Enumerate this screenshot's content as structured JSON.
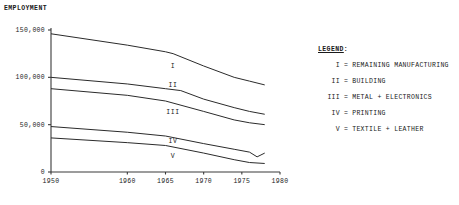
{
  "chart_data": {
    "type": "line",
    "title": "",
    "ylabel": "EMPLOYMENT",
    "xlabel": "",
    "xlim": [
      1950,
      1980
    ],
    "ylim": [
      0,
      150000
    ],
    "grid": false,
    "legend_position": "right",
    "xticks": [
      1950,
      1960,
      1965,
      1970,
      1975,
      1980
    ],
    "xtick_labels": [
      "1950",
      "1960",
      "1965",
      "1970",
      "1975",
      "1980"
    ],
    "yticks": [
      0,
      50000,
      100000,
      150000
    ],
    "ytick_labels": [
      "0",
      "50,000",
      "100,000",
      "150,000"
    ],
    "series": [
      {
        "name": "I",
        "label": "REMAINING MANUFACTURING",
        "x": [
          1950,
          1960,
          1965,
          1966,
          1970,
          1974,
          1976,
          1978
        ],
        "values": [
          146000,
          134000,
          127000,
          125000,
          112000,
          100000,
          96000,
          92000
        ]
      },
      {
        "name": "II",
        "label": "BUILDING",
        "x": [
          1950,
          1960,
          1965,
          1967,
          1970,
          1974,
          1976,
          1978
        ],
        "values": [
          100000,
          93000,
          88000,
          86000,
          77000,
          68000,
          64000,
          61000
        ]
      },
      {
        "name": "III",
        "label": "METAL + ELECTRONICS",
        "x": [
          1950,
          1960,
          1965,
          1970,
          1974,
          1976,
          1978
        ],
        "values": [
          88000,
          81000,
          75000,
          64000,
          55000,
          52000,
          50000
        ]
      },
      {
        "name": "IV",
        "label": "PRINTING",
        "x": [
          1950,
          1960,
          1965,
          1970,
          1974,
          1976,
          1977,
          1978
        ],
        "values": [
          48000,
          42000,
          38000,
          30000,
          24000,
          21000,
          16000,
          20000
        ]
      },
      {
        "name": "V",
        "label": "TEXTILE + LEATHER",
        "x": [
          1950,
          1960,
          1965,
          1970,
          1974,
          1976,
          1978
        ],
        "values": [
          36000,
          31000,
          28000,
          20000,
          13000,
          10000,
          9000
        ]
      }
    ],
    "band_labels": [
      {
        "text": "I",
        "x": 1966,
        "y": 112000
      },
      {
        "text": "II",
        "x": 1966,
        "y": 92000
      },
      {
        "text": "III",
        "x": 1966,
        "y": 63000
      },
      {
        "text": "IV",
        "x": 1966,
        "y": 33000
      },
      {
        "text": "V",
        "x": 1966,
        "y": 17000
      }
    ]
  },
  "legend": {
    "title": "LEGEND",
    "title_colon": ":",
    "equals": "=",
    "entries": [
      {
        "symbol": "I",
        "name": "REMAINING MANUFACTURING"
      },
      {
        "symbol": "II",
        "name": "BUILDING"
      },
      {
        "symbol": "III",
        "name": "METAL + ELECTRONICS"
      },
      {
        "symbol": "IV",
        "name": "PRINTING"
      },
      {
        "symbol": "V",
        "name": "TEXTILE + LEATHER"
      }
    ]
  },
  "style": {
    "line_color": "#2b2b2b",
    "axis_color": "#3a3a3a",
    "background": "#ffffff"
  }
}
